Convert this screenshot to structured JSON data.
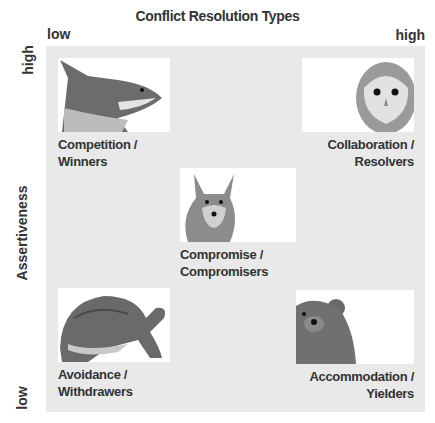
{
  "title": "Conflict Resolution Types",
  "x_axis": {
    "low": "low",
    "high": "high"
  },
  "y_axis": {
    "label": "Assertiveness",
    "low": "low",
    "high": "high"
  },
  "quadrants": [
    {
      "id": "competition",
      "line1": "Competition /",
      "line2": "Winners",
      "animal": "shark"
    },
    {
      "id": "collaboration",
      "line1": "Collaboration /",
      "line2": "Resolvers",
      "animal": "owl"
    },
    {
      "id": "compromise",
      "line1": "Compromise /",
      "line2": "Compromisers",
      "animal": "fox"
    },
    {
      "id": "avoidance",
      "line1": "Avoidance /",
      "line2": "Withdrawers",
      "animal": "turtle"
    },
    {
      "id": "accommodation",
      "line1": "Accommodation /",
      "line2": "Yielders",
      "animal": "teddy-bear"
    }
  ],
  "colors": {
    "panel": "#e9e9e9",
    "text": "#333333"
  }
}
